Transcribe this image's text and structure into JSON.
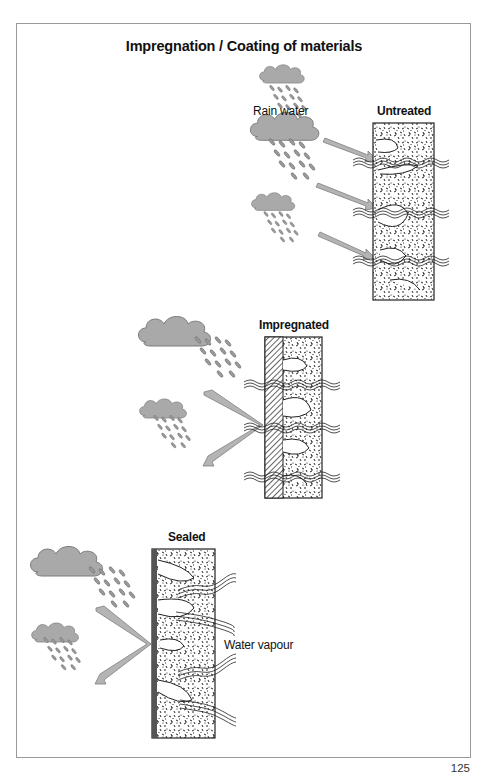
{
  "title": "Impregnation / Coating of materials",
  "labels": {
    "rain_water": "Rain water",
    "untreated": "Untreated",
    "impregnated": "Impregnated",
    "sealed": "Sealed",
    "water_vapour": "Water vapour"
  },
  "page_number": "125",
  "colors": {
    "cloud_fill": "#a9a9a9",
    "cloud_stroke": "#7a7a7a",
    "arrow_fill": "#b4b4b4",
    "arrow_stroke": "#7d7d7d",
    "coating": "#555555",
    "wall_stroke": "#222222",
    "frame": "#9a9a9a"
  },
  "panels": [
    {
      "name": "untreated",
      "description": "Rain water penetrates untreated porous material"
    },
    {
      "name": "impregnated",
      "description": "Impregnated surface repels rain water; water vapour passes"
    },
    {
      "name": "sealed",
      "description": "Sealed surface repels rain water; water vapour trapped/exits rear"
    }
  ]
}
